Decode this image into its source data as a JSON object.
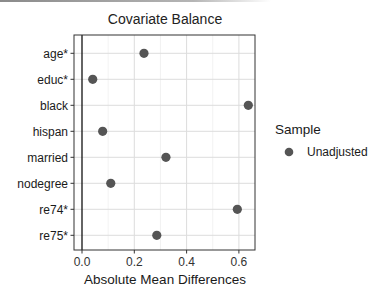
{
  "chart_data": {
    "type": "scatter",
    "title": "Covariate Balance",
    "xlabel": "Absolute Mean Differences",
    "ylabel": "",
    "xlim": [
      -0.03,
      0.67
    ],
    "xticks": [
      "0.0",
      "0.2",
      "0.4",
      "0.6"
    ],
    "grid": true,
    "legend_position": "right",
    "legend_title": "Sample",
    "categories": [
      "age*",
      "educ*",
      "black",
      "hispan",
      "married",
      "nodegree",
      "re74*",
      "re75*"
    ],
    "series": [
      {
        "name": "Unadjusted",
        "color": "#555555",
        "values": [
          0.237,
          0.041,
          0.636,
          0.079,
          0.321,
          0.11,
          0.594,
          0.286
        ]
      }
    ],
    "reference_line": 0
  }
}
